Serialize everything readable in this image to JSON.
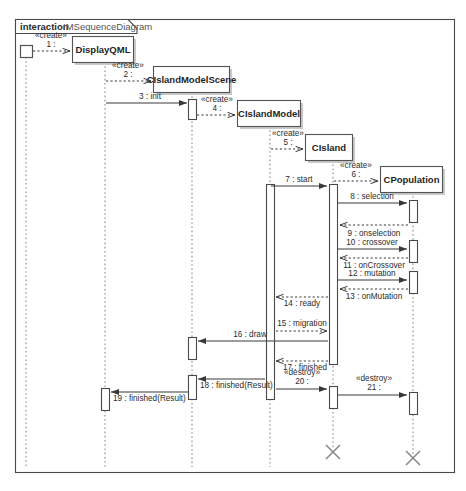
{
  "frame": {
    "keyword": "interaction",
    "name": "IMSequenceDiagram"
  },
  "lifelines": [
    {
      "id": "actor",
      "label": "",
      "kind": "actor-square",
      "x": 26,
      "box_top": 45,
      "box_bottom": 57
    },
    {
      "id": "displayqml",
      "label": "DisplayQML",
      "kind": "class-box",
      "x": 105,
      "box_top": 36,
      "box_bottom": 62
    },
    {
      "id": "cislandmodelscene",
      "label": "CIslandModelScene",
      "kind": "class-box",
      "x": 192,
      "box_top": 66,
      "box_bottom": 92
    },
    {
      "id": "cislandmodel",
      "label": "CIslandModel",
      "kind": "class-box",
      "x": 270,
      "box_top": 100,
      "box_bottom": 126
    },
    {
      "id": "cisland",
      "label": "CIsland",
      "kind": "class-box",
      "x": 333,
      "box_top": 134,
      "box_bottom": 160
    },
    {
      "id": "cpopulation",
      "label": "CPopulation",
      "kind": "class-box",
      "x": 413,
      "box_top": 166,
      "box_bottom": 192
    }
  ],
  "messages": [
    {
      "seq": "1",
      "label": "1 :",
      "stereotype": "«create»",
      "from": "actor",
      "to": "displayqml",
      "y": 51,
      "style": "dashed-create"
    },
    {
      "seq": "2",
      "label": "2 :",
      "stereotype": "«create»",
      "from": "displayqml",
      "to": "cislandmodelscene",
      "y": 81,
      "style": "dashed-create"
    },
    {
      "seq": "3",
      "label": "3 : init",
      "stereotype": "",
      "from": "displayqml",
      "to": "cislandmodelscene",
      "y": 103,
      "style": "solid"
    },
    {
      "seq": "4",
      "label": "4 :",
      "stereotype": "«create»",
      "from": "cislandmodelscene",
      "to": "cislandmodel",
      "y": 115,
      "style": "dashed-create"
    },
    {
      "seq": "5",
      "label": "5 :",
      "stereotype": "«create»",
      "from": "cislandmodel",
      "to": "cisland",
      "y": 149,
      "style": "dashed-create"
    },
    {
      "seq": "6",
      "label": "6 :",
      "stereotype": "«create»",
      "from": "cisland",
      "to": "cpopulation",
      "y": 181,
      "style": "dashed-create"
    },
    {
      "seq": "7",
      "label": "7 : start",
      "stereotype": "",
      "from": "cislandmodel",
      "to": "cisland",
      "y": 186,
      "style": "solid"
    },
    {
      "seq": "8",
      "label": "8 : selection",
      "stereotype": "",
      "from": "cisland",
      "to": "cpopulation",
      "y": 203,
      "style": "solid"
    },
    {
      "seq": "9",
      "label": "9 : onselection",
      "stereotype": "",
      "from": "cpopulation",
      "to": "cisland",
      "y": 228,
      "style": "dashed-return"
    },
    {
      "seq": "10",
      "label": "10 : crossover",
      "stereotype": "",
      "from": "cisland",
      "to": "cpopulation",
      "y": 243,
      "style": "solid"
    },
    {
      "seq": "11",
      "label": "11 : onCrossover",
      "stereotype": "",
      "from": "cpopulation",
      "to": "cisland",
      "y": 261,
      "style": "dashed-return"
    },
    {
      "seq": "12",
      "label": "12 : mutation",
      "stereotype": "",
      "from": "cisland",
      "to": "cpopulation",
      "y": 274,
      "style": "solid"
    },
    {
      "seq": "13",
      "label": "13 : onMutation",
      "stereotype": "",
      "from": "cpopulation",
      "to": "cisland",
      "y": 292,
      "style": "dashed-return"
    },
    {
      "seq": "14",
      "label": "14 : ready",
      "stereotype": "",
      "from": "cisland",
      "to": "cislandmodel",
      "y": 301,
      "style": "dashed-return"
    },
    {
      "seq": "15",
      "label": "15 : migration",
      "stereotype": "",
      "from": "cislandmodel",
      "to": "cisland",
      "y": 330,
      "style": "dashed-create"
    },
    {
      "seq": "16",
      "label": "16 : draw",
      "stereotype": "",
      "from": "cislandmodel",
      "to": "cislandmodelscene",
      "y": 342,
      "style": "solid-return"
    },
    {
      "seq": "17",
      "label": "17 : finished",
      "stereotype": "",
      "from": "cisland",
      "to": "cislandmodel",
      "y": 361,
      "style": "dashed-return"
    },
    {
      "seq": "18",
      "label": "18 : finished(Result)",
      "stereotype": "",
      "from": "cislandmodel",
      "to": "cislandmodelscene",
      "y": 381,
      "style": "solid-return"
    },
    {
      "seq": "19",
      "label": "19 : finished(Result)",
      "stereotype": "",
      "from": "cislandmodelscene",
      "to": "displayqml",
      "y": 394,
      "style": "solid-return"
    },
    {
      "seq": "20",
      "label": "20 :",
      "stereotype": "«destroy»",
      "from": "cislandmodel",
      "to": "cisland",
      "y": 389,
      "style": "solid"
    },
    {
      "seq": "21",
      "label": "21 :",
      "stereotype": "«destroy»",
      "from": "cisland",
      "to": "cpopulation",
      "y": 395,
      "style": "solid"
    }
  ],
  "destroyed_lifelines": [
    {
      "id": "cisland",
      "x": 333,
      "y": 452
    },
    {
      "id": "cpopulation",
      "x": 413,
      "y": 458
    }
  ],
  "colors": {
    "frame_stroke": "#4a4a4a",
    "box_stroke": "#545454",
    "lifeline_dash": "#8a8a8a",
    "message_stroke": "#3a3a3a",
    "text": "#2b2b2b",
    "background": "#ffffff"
  }
}
